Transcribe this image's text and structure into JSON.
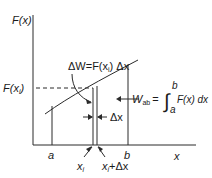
{
  "diagram": {
    "y_axis_label": "F(x)",
    "x_axis_label": "x",
    "f_xi_label": "F(x",
    "f_xi_sub": "i",
    "f_xi_close": ")",
    "a_label": "a",
    "b_label": "b",
    "xi_label": "x",
    "xi_sub": "i",
    "xi_dx_label_x": "x",
    "xi_dx_label_sub": "i",
    "xi_dx_label_rest": "+Δx",
    "dx_label": "Δx",
    "delta_w": {
      "prefix": "ΔW=F(x",
      "sub": "i",
      "suffix": ") Δx"
    },
    "w_ab": {
      "w": "W",
      "sub": "ab",
      "equals": "=",
      "integral": "∫",
      "upper": "b",
      "lower": "a",
      "integrand": "F(x) dx"
    },
    "colors": {
      "line": "#2a2a2a",
      "text": "#1a1a1a",
      "background": "#ffffff"
    }
  }
}
